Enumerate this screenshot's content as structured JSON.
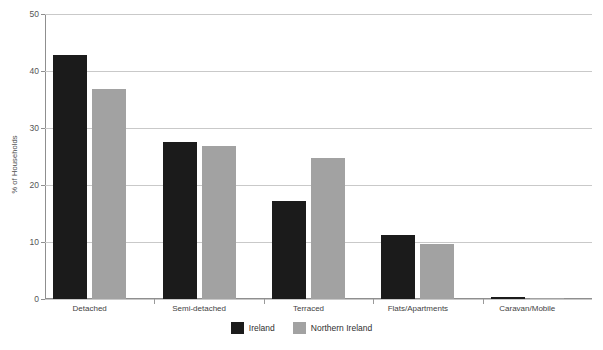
{
  "chart_data": {
    "type": "bar",
    "title": "",
    "xlabel": "",
    "ylabel": "% of Households",
    "ylim": [
      0,
      50
    ],
    "yticks": [
      0,
      10,
      20,
      30,
      40,
      50
    ],
    "grid": true,
    "legend_position": "bottom-center",
    "categories": [
      "Detached",
      "Semi-detached",
      "Terraced",
      "Flats/Apartments",
      "Caravan/Mobile"
    ],
    "series": [
      {
        "name": "Ireland",
        "color": "#1b1b1b",
        "values": [
          42.8,
          27.5,
          17.2,
          11.3,
          0.3
        ]
      },
      {
        "name": "Northern Ireland",
        "color": "#a2a2a2",
        "values": [
          36.8,
          26.8,
          24.7,
          9.7,
          0.1
        ]
      }
    ]
  },
  "axis": {
    "y_title": "% of Households",
    "y_tick_labels": [
      "0",
      "10",
      "20",
      "30",
      "40",
      "50"
    ]
  },
  "legend": {
    "items": [
      {
        "label": "Ireland",
        "color": "#1b1b1b"
      },
      {
        "label": "Northern Ireland",
        "color": "#a2a2a2"
      }
    ]
  },
  "colors": {
    "background": "#ffffff",
    "ireland": "#1b1b1b",
    "northern_ireland": "#a2a2a2",
    "gridline": "#c9c9c9",
    "axis": "#8f8f8f"
  }
}
